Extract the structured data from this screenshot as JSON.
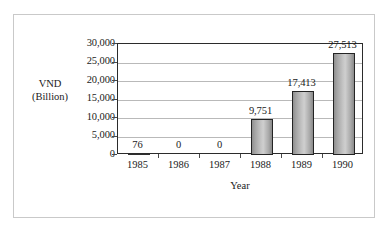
{
  "chart_data": {
    "type": "bar",
    "title": "",
    "categories": [
      "1985",
      "1986",
      "1987",
      "1988",
      "1989",
      "1990"
    ],
    "values": [
      76,
      0,
      0,
      9751,
      17413,
      27513
    ],
    "data_labels": [
      "76",
      "0",
      "0",
      "9,751",
      "17,413",
      "27,513"
    ],
    "xlabel": "Year",
    "ylabel": "VND (Billion)",
    "ylabel_line1": "VND",
    "ylabel_line2": "(Billion)",
    "ylim": [
      0,
      30000
    ],
    "ytick_values": [
      0,
      5000,
      10000,
      15000,
      20000,
      25000,
      30000
    ],
    "ytick_labels": [
      "0",
      "5,000",
      "10,000",
      "15,000",
      "20,000",
      "25,000",
      "30,000"
    ],
    "grid": true,
    "legend": false,
    "colors": {
      "bar_fill_light": "#cfcfcf",
      "bar_fill_dark": "#8a8a8a",
      "bar_border": "#242424",
      "gridline": "#b9b9b9",
      "plot_border": "#2b2b2b",
      "outer_frame": "#c9c9c9",
      "background": "#ffffff",
      "text": "#1a1a1a"
    }
  }
}
